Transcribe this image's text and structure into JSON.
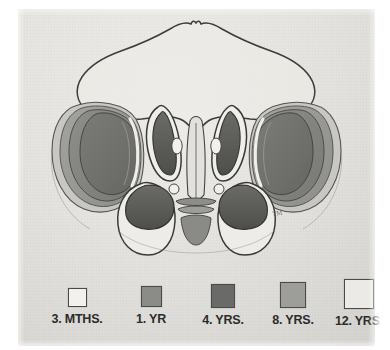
{
  "plate": {
    "title": "Development of the paranasal sinuses",
    "view": "coronal section",
    "paper_color": "#e5e3df",
    "ink_color": "#3a3a38",
    "signature": "artist-monogram"
  },
  "legend": {
    "position": "bottom",
    "items": [
      {
        "label": "3. MTHS.",
        "age": "3 months",
        "color": "#f2f1ee",
        "order": 1
      },
      {
        "label": "1. YR",
        "age": "1 year",
        "color": "#8b8b88",
        "order": 2
      },
      {
        "label": "4. YRS.",
        "age": "4 years",
        "color": "#6a6a68",
        "order": 3
      },
      {
        "label": "8. YRS.",
        "age": "8 years",
        "color": "#9d9d99",
        "order": 4
      },
      {
        "label": "12. YRS.",
        "age": "12 years",
        "color": "#eceae6",
        "order": 5
      }
    ]
  },
  "figure": {
    "name": "paranasal-sinus-growth-diagram",
    "structures": [
      {
        "name": "frontal-sinus-outline",
        "tone": "outline"
      },
      {
        "name": "left-maxillary-sinus-shells",
        "tone": "graduated-gray"
      },
      {
        "name": "right-maxillary-sinus-shells",
        "tone": "graduated-gray"
      },
      {
        "name": "left-ethmoid-air-cells",
        "tone": "dark-gray"
      },
      {
        "name": "right-ethmoid-air-cells",
        "tone": "dark-gray"
      },
      {
        "name": "nasal-septum",
        "tone": "mid-gray"
      },
      {
        "name": "left-antrum-lobe",
        "tone": "dark-gray"
      },
      {
        "name": "right-antrum-lobe",
        "tone": "dark-gray"
      }
    ]
  }
}
